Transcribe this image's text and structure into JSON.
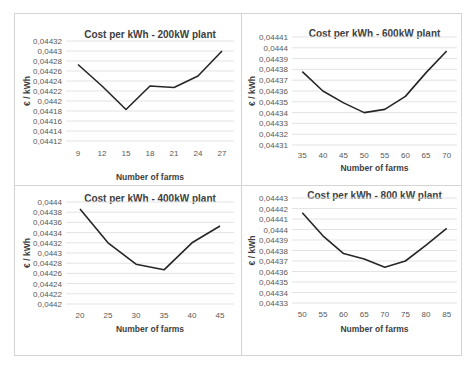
{
  "chart_data": [
    {
      "type": "line",
      "title": "Cost per kWh - 200kW  plant",
      "xlabel": "Number of farms",
      "ylabel": "€ / kWh",
      "categories": [
        "9",
        "12",
        "15",
        "18",
        "21",
        "24",
        "27"
      ],
      "values": [
        0.044273,
        0.04423,
        0.044183,
        0.04423,
        0.044227,
        0.04425,
        0.0443
      ],
      "yticks": [
        "0,04432",
        "0,0443",
        "0,04428",
        "0,04426",
        "0,04424",
        "0,04422",
        "0,0442",
        "0,04418",
        "0,04416",
        "0,04414",
        "0,04412"
      ],
      "ylim": [
        0.04412,
        0.04432
      ],
      "grid": true,
      "legend": "none"
    },
    {
      "type": "line",
      "title": "Cost per kWh - 600kW  plant",
      "xlabel": "Number of farms",
      "ylabel": "€ / kWh",
      "categories": [
        "35",
        "40",
        "45",
        "50",
        "55",
        "60",
        "65",
        "70"
      ],
      "values": [
        0.044378,
        0.04436,
        0.044349,
        0.04434,
        0.044343,
        0.044355,
        0.044377,
        0.044397
      ],
      "yticks": [
        "0,04441",
        "0,0444",
        "0,04439",
        "0,04438",
        "0,04437",
        "0,04436",
        "0,04435",
        "0,04434",
        "0,04433",
        "0,04432",
        "0,04431"
      ],
      "ylim": [
        0.04431,
        0.04441
      ],
      "grid": true,
      "legend": "none"
    },
    {
      "type": "line",
      "title": "Cost per kWh - 400kW  plant",
      "xlabel": "Number of farms",
      "ylabel": "€ / kWh",
      "categories": [
        "20",
        "25",
        "30",
        "35",
        "40",
        "45"
      ],
      "values": [
        0.044386,
        0.04432,
        0.044278,
        0.044267,
        0.04432,
        0.044353
      ],
      "yticks": [
        "0,0444",
        "0,04438",
        "0,04436",
        "0,04434",
        "0,04432",
        "0,0443",
        "0,04428",
        "0,04426",
        "0,04424",
        "0,04422",
        "0,0442"
      ],
      "ylim": [
        0.0442,
        0.0444
      ],
      "grid": true,
      "legend": "none"
    },
    {
      "type": "line",
      "title": "Cost per kWh - 800 kW plant",
      "xlabel": "Number of farms",
      "ylabel": "€ / kWh",
      "categories": [
        "50",
        "55",
        "60",
        "65",
        "70",
        "75",
        "80",
        "85"
      ],
      "values": [
        0.044416,
        0.044394,
        0.044377,
        0.044372,
        0.044364,
        0.04437,
        0.044385,
        0.044401
      ],
      "yticks": [
        "0,04443",
        "0,04442",
        "0,04441",
        "0,0444",
        "0,04439",
        "0,04438",
        "0,04437",
        "0,04436",
        "0,04435",
        "0,04434",
        "0,04433"
      ],
      "ylim": [
        0.04433,
        0.04443
      ],
      "grid": true,
      "legend": "none"
    }
  ],
  "colors": {
    "line": "#262626",
    "grid": "#e3e3e3",
    "border": "#d4d4d4",
    "text": "#404040"
  }
}
